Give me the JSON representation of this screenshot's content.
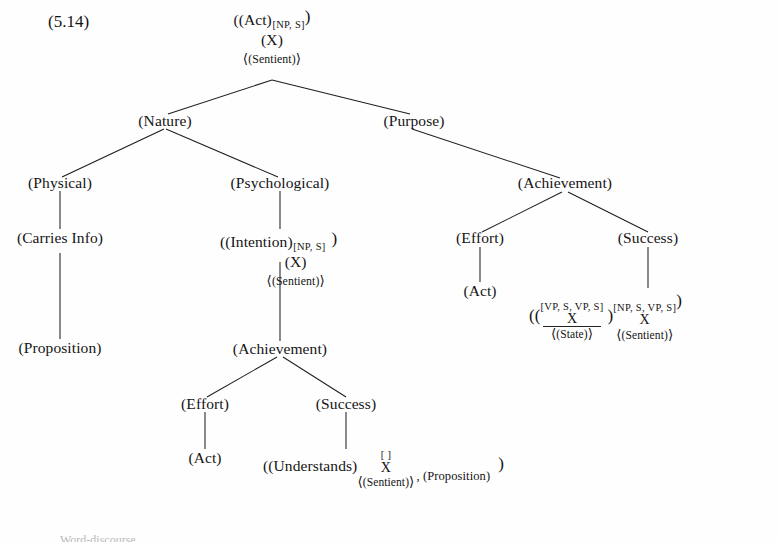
{
  "figure": {
    "example_number": "(5.14)",
    "type": "linguistic-semantic-tree",
    "caption_fragment": "Word-discourse..."
  },
  "root": {
    "line1_open": "((Act)",
    "line1_sub": "[NP, S]",
    "line1_close": ")",
    "line2": "(X)",
    "line3_open": "⟨",
    "line3_text": "(Sentient)",
    "line3_close": "⟩"
  },
  "nodes": {
    "nature": "(Nature)",
    "purpose": "(Purpose)",
    "physical": "(Physical)",
    "psychological": "(Psychological)",
    "carries_info": "(Carries Info)",
    "proposition_left": "(Proposition)",
    "achievement_right": "(Achievement)",
    "achievement_mid": "(Achievement)",
    "effort_right": "(Effort)",
    "success_right": "(Success)",
    "act_right": "(Act)",
    "effort_mid": "(Effort)",
    "success_mid": "(Success)",
    "act_mid": "(Act)"
  },
  "intention_node": {
    "open": "((Intention)",
    "sub": "[NP, S]",
    "close": ")",
    "line2": "(X)",
    "ang_open": "⟨",
    "ang_text": "(Sentient)",
    "ang_close": "⟩"
  },
  "success_right_node": {
    "open": "((",
    "inner_feat": "[VP, S, VP, S]",
    "inner_var": "X",
    "inner_sem_open": "⟨",
    "inner_sem_text": "(State)",
    "inner_sem_close": "⟩",
    "mid_close": ")",
    "outer_sub": "[NP, S, VP, S]",
    "outer_close": ")",
    "var2": "X",
    "sem2_open": "⟨",
    "sem2_text": "(Sentient)",
    "sem2_close": "⟩"
  },
  "understands_node": {
    "open": "((Understands)",
    "sub_empty": "[    ]",
    "var": "X",
    "sem_open": "⟨",
    "sem_text": "(Sentient)",
    "sem_close": "⟩",
    "comma_arg": ", (Proposition)",
    "close": ")"
  },
  "colors": {
    "ink": "#141414",
    "line": "#1f1f1f",
    "background": "#fefefe"
  }
}
